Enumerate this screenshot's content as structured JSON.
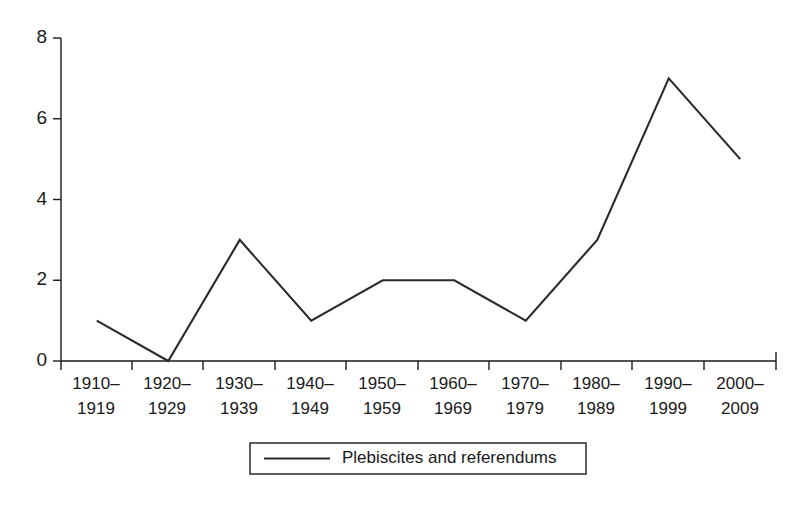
{
  "chart_data": {
    "type": "line",
    "title": "",
    "subtitle": "",
    "xlabel": "",
    "ylabel": "",
    "categories": [
      "1910–\n1919",
      "1920–\n1929",
      "1930–\n1939",
      "1940–\n1949",
      "1950–\n1959",
      "1960–\n1969",
      "1970–\n1979",
      "1980–\n1989",
      "1990–\n1999",
      "2000–\n2009"
    ],
    "category_lines": [
      [
        "1910–",
        "1919"
      ],
      [
        "1920–",
        "1929"
      ],
      [
        "1930–",
        "1939"
      ],
      [
        "1940–",
        "1949"
      ],
      [
        "1950–",
        "1959"
      ],
      [
        "1960–",
        "1969"
      ],
      [
        "1970–",
        "1979"
      ],
      [
        "1980–",
        "1989"
      ],
      [
        "1990–",
        "1999"
      ],
      [
        "2000–",
        "2009"
      ]
    ],
    "series": [
      {
        "name": "Plebiscites and referendums",
        "values": [
          1,
          0,
          3,
          1,
          2,
          2,
          1,
          3,
          7,
          5
        ],
        "color": "#2a2a2a"
      }
    ],
    "values": [
      1,
      0,
      3,
      1,
      2,
      2,
      1,
      3,
      7,
      5
    ],
    "ylim": [
      0,
      8
    ],
    "yticks": [
      0,
      2,
      4,
      6,
      8
    ],
    "ytick_labels": [
      "0",
      "2",
      "4",
      "6",
      "8"
    ],
    "grid": false,
    "legend_position": "bottom-center",
    "legend_entries": [
      "Plebiscites and referendums"
    ],
    "annotations": []
  },
  "axes": {
    "y_labels": [
      "8",
      "6",
      "4",
      "2",
      "0"
    ],
    "x_labels_top": [
      "1910–",
      "1920–",
      "1930–",
      "1940–",
      "1950–",
      "1960–",
      "1970–",
      "1980–",
      "1990–",
      "2000–"
    ],
    "x_labels_bottom": [
      "1919",
      "1929",
      "1939",
      "1949",
      "1959",
      "1969",
      "1979",
      "1989",
      "1999",
      "2009"
    ]
  },
  "legend": {
    "label": "Plebiscites and referendums"
  },
  "colors": {
    "line": "#2a2a2a",
    "axis": "#1a1a1a",
    "background": "#ffffff",
    "text": "#1a1a1a"
  },
  "caption": {
    "partial_text": ""
  }
}
